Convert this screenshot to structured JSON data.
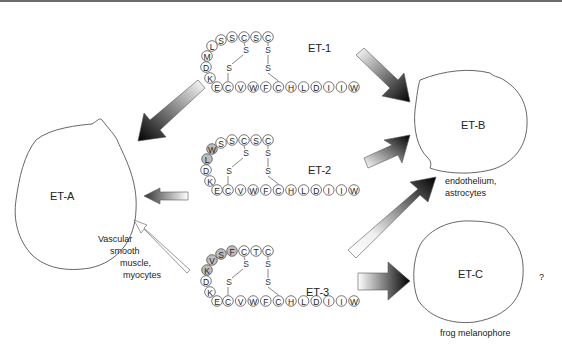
{
  "receptors": {
    "eta": {
      "label": "ET-A",
      "tissue": [
        "Vascular",
        "smooth",
        "muscle,",
        "myocytes"
      ]
    },
    "etb": {
      "label": "ET-B",
      "tissue": [
        "endothelium,",
        "astrocytes"
      ]
    },
    "etc": {
      "label": "ET-C",
      "tissue": [
        "frog melanophore"
      ],
      "note": "?"
    }
  },
  "peptides": {
    "et1": {
      "label": "ET-1",
      "loop": [
        "E",
        "K",
        "D",
        "M",
        "L",
        "S",
        "S",
        "C",
        "S",
        "C"
      ],
      "tail": [
        "C",
        "V",
        "W",
        "F",
        "C",
        "H",
        "L",
        "D",
        "I",
        "I",
        "W"
      ],
      "shaded": []
    },
    "et2": {
      "label": "ET-2",
      "loop": [
        "E",
        "K",
        "D",
        "L",
        "W",
        "S",
        "S",
        "C",
        "S",
        "C"
      ],
      "tail": [
        "C",
        "V",
        "W",
        "F",
        "C",
        "H",
        "L",
        "D",
        "I",
        "I",
        "W"
      ],
      "shaded": [
        3,
        4
      ]
    },
    "et3": {
      "label": "ET-3",
      "loop": [
        "E",
        "K",
        "D",
        "K",
        "V",
        "S",
        "F",
        "C",
        "T",
        "C"
      ],
      "tail": [
        "C",
        "V",
        "W",
        "F",
        "C",
        "H",
        "L",
        "D",
        "I",
        "I",
        "W"
      ],
      "shaded": [
        3,
        4,
        5,
        6
      ]
    }
  },
  "disulfide_label": "S",
  "colors": {
    "arrow_dark": "#000000",
    "arrow_light": "#ffffff",
    "outline": "#555555"
  }
}
